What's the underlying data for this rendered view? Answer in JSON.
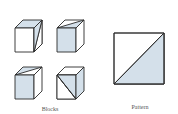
{
  "figure": {
    "blocks_caption": "Blocks",
    "pattern_caption": "Pattern",
    "colors": {
      "fill_blue": "#d4e0ea",
      "fill_white": "#ffffff",
      "stroke": "#2a2a2a"
    },
    "blocks": [
      {
        "position": "top-left",
        "description": "front white, top blue, right face diagonally split"
      },
      {
        "position": "top-right",
        "description": "front blue, top diagonally split, right white"
      },
      {
        "position": "bottom-left",
        "description": "front blue, top diagonally split, right white"
      },
      {
        "position": "bottom-right",
        "description": "front diagonally split, top white, right blue"
      }
    ],
    "pattern": {
      "description": "square split by diagonal from bottom-left to top-right, lower-right half blue"
    }
  }
}
